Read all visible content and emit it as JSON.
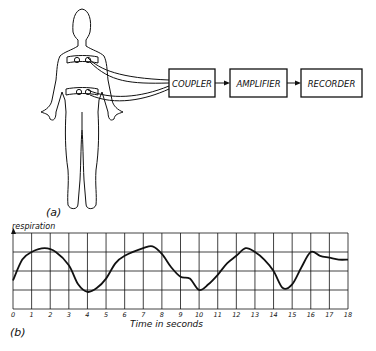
{
  "part_a": {
    "label": "(a)",
    "blocks": [
      {
        "id": "coupler",
        "label": "COUPLER"
      },
      {
        "id": "amplifier",
        "label": "AMPLIFIER"
      },
      {
        "id": "recorder",
        "label": "RECORDER"
      }
    ]
  },
  "part_b": {
    "label": "(b)",
    "ylabel": "respiration",
    "xlabel": "Time in seconds",
    "ticks": [
      "0",
      "1",
      "2",
      "3",
      "4",
      "5",
      "6",
      "7",
      "8",
      "9",
      "10",
      "11",
      "12",
      "13",
      "14",
      "15",
      "16",
      "17",
      "18"
    ]
  },
  "colors": {
    "ink": "#111111",
    "background": "#ffffff"
  },
  "chart_data": {
    "type": "line",
    "title": "",
    "xlabel": "Time in seconds",
    "ylabel": "respiration",
    "xlim": [
      0,
      18
    ],
    "ylim": [
      0,
      4
    ],
    "grid": true,
    "x": [
      0,
      0.5,
      1,
      1.7,
      2.3,
      3,
      3.5,
      4,
      4.5,
      5,
      5.5,
      6,
      7,
      7.5,
      8,
      8.5,
      9,
      9.5,
      10,
      10.5,
      11,
      11.5,
      12,
      12.5,
      13,
      13.5,
      14,
      14.5,
      15,
      15.5,
      16,
      16.5,
      17,
      17.5,
      18
    ],
    "series": [
      {
        "name": "respiration",
        "values": [
          1.5,
          2.6,
          3.0,
          3.2,
          3.0,
          2.3,
          1.3,
          0.9,
          1.1,
          1.6,
          2.4,
          2.8,
          3.2,
          3.3,
          2.9,
          2.2,
          1.7,
          1.6,
          1.0,
          1.3,
          1.8,
          2.4,
          2.8,
          3.2,
          3.0,
          2.6,
          2.0,
          1.1,
          1.3,
          2.2,
          3.0,
          2.8,
          2.7,
          2.6,
          2.6
        ]
      }
    ]
  }
}
